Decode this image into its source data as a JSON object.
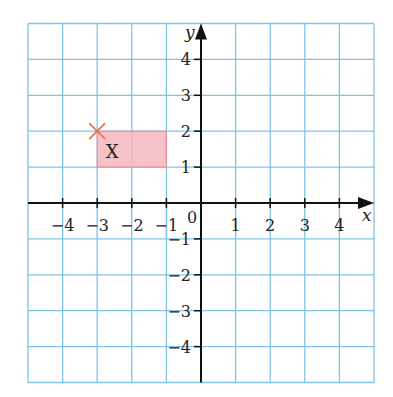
{
  "diagram": {
    "type": "coordinate-grid",
    "axes": {
      "x_label": "x",
      "y_label": "y",
      "origin_label": "0",
      "x_range": [
        -5,
        5
      ],
      "y_range": [
        -5,
        5
      ],
      "x_ticks": [
        {
          "value": -4,
          "label": "−4"
        },
        {
          "value": -3,
          "label": "−3"
        },
        {
          "value": -2,
          "label": "−2"
        },
        {
          "value": -1,
          "label": "−1"
        },
        {
          "value": 1,
          "label": "1"
        },
        {
          "value": 2,
          "label": "2"
        },
        {
          "value": 3,
          "label": "3"
        },
        {
          "value": 4,
          "label": "4"
        }
      ],
      "y_ticks": [
        {
          "value": 4,
          "label": "4"
        },
        {
          "value": 3,
          "label": "3"
        },
        {
          "value": 2,
          "label": "2"
        },
        {
          "value": 1,
          "label": "1"
        },
        {
          "value": -1,
          "label": "−1"
        },
        {
          "value": -2,
          "label": "−2"
        },
        {
          "value": -3,
          "label": "−3"
        },
        {
          "value": -4,
          "label": "−4"
        }
      ]
    },
    "shape": {
      "label": "X",
      "vertices": [
        [
          -3,
          2
        ],
        [
          -1,
          2
        ],
        [
          -1,
          1
        ],
        [
          -3,
          1
        ]
      ],
      "fill_color": "#f5b6bd",
      "stroke_color": "#f08a96"
    },
    "marker": {
      "type": "cross",
      "point": [
        -3,
        2
      ],
      "color": "#e8734e"
    },
    "colors": {
      "grid": "#7fc4e8",
      "axis": "#111111",
      "background": "#ffffff"
    }
  }
}
